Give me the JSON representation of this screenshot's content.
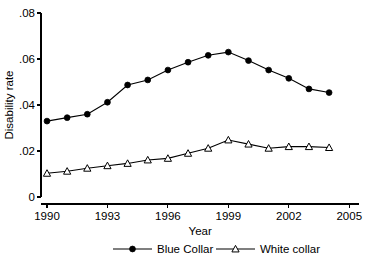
{
  "chart_data": {
    "type": "line",
    "title": "",
    "xlabel": "Year",
    "ylabel": "Disability rate",
    "xlim": [
      1989.0,
      2005.5
    ],
    "ylim": [
      0,
      0.08
    ],
    "grid": false,
    "legend_position": "bottom",
    "x": [
      1990,
      1991,
      1992,
      1993,
      1994,
      1995,
      1996,
      1997,
      1998,
      1999,
      2000,
      2001,
      2002,
      2003,
      2004
    ],
    "xticks": [
      "1990",
      "1993",
      "1996",
      "1999",
      "2002",
      "2005"
    ],
    "xtick_values": [
      1990,
      1993,
      1996,
      1999,
      2002,
      2005
    ],
    "yticks": [
      "0",
      ".02",
      ".04",
      ".06",
      ".08"
    ],
    "ytick_values": [
      0,
      0.02,
      0.04,
      0.06,
      0.08
    ],
    "series": [
      {
        "name": "Blue Collar",
        "marker": "filled-circle",
        "values": [
          0.033,
          0.0345,
          0.036,
          0.0412,
          0.0487,
          0.0509,
          0.0552,
          0.0586,
          0.0616,
          0.063,
          0.0593,
          0.0552,
          0.0516,
          0.047,
          0.0454
        ]
      },
      {
        "name": "White collar",
        "marker": "open-triangle",
        "values": [
          0.0103,
          0.0112,
          0.0125,
          0.0136,
          0.0146,
          0.0161,
          0.0168,
          0.019,
          0.0212,
          0.0248,
          0.023,
          0.0212,
          0.0219,
          0.0219,
          0.0215
        ]
      }
    ]
  },
  "legend": {
    "items": [
      {
        "label": "Blue Collar",
        "marker": "filled-circle"
      },
      {
        "label": "White collar",
        "marker": "open-triangle"
      }
    ]
  },
  "colors": {
    "ink": "#000000",
    "background": "#ffffff"
  }
}
